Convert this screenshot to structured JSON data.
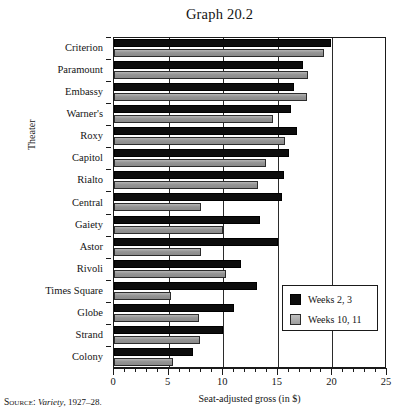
{
  "chart_data": {
    "type": "bar",
    "orientation": "horizontal",
    "title": "Graph 20.2",
    "xlabel": "Seat-adjusted gross (in $)",
    "ylabel": "Theater",
    "xlim": [
      0,
      25
    ],
    "xticks": [
      0,
      5,
      10,
      15,
      20,
      25
    ],
    "xtick_labels": [
      "0",
      "5",
      "10",
      "15",
      "20",
      "25"
    ],
    "minor_tick_step": 1,
    "grid": "vertical-major",
    "legend_position": "inside lower right",
    "categories": [
      "Criterion",
      "Paramount",
      "Embassy",
      "Warner's",
      "Roxy",
      "Capitol",
      "Rialto",
      "Central",
      "Gaiety",
      "Astor",
      "Rivoli",
      "Times Square",
      "Globe",
      "Strand",
      "Colony"
    ],
    "series": [
      {
        "name": "Weeks 2, 3",
        "color": "#0d0d0d",
        "values": [
          19.9,
          17.3,
          16.5,
          16.2,
          16.8,
          16.0,
          15.6,
          15.4,
          13.4,
          15.0,
          11.6,
          13.1,
          11.0,
          10.0,
          7.2
        ]
      },
      {
        "name": "Weeks 10, 11",
        "color": "#9a9a9a",
        "values": [
          19.2,
          17.8,
          17.7,
          14.6,
          15.7,
          13.9,
          13.2,
          8.0,
          10.0,
          8.0,
          10.3,
          5.2,
          7.8,
          7.9,
          5.4
        ]
      }
    ]
  },
  "legend": {
    "entries": [
      {
        "label": "Weeks 2, 3",
        "swatch": "dark"
      },
      {
        "label": "Weeks 10, 11",
        "swatch": "light"
      }
    ]
  },
  "source_note": {
    "prefix": "Source:",
    "publication": "Variety",
    "years": ", 1927–28."
  }
}
